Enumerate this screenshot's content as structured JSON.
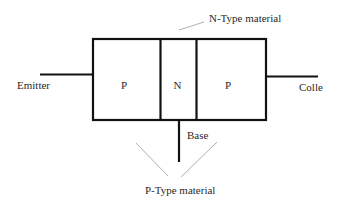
{
  "diagram": {
    "regions": [
      {
        "label": "P",
        "type": "P-Type"
      },
      {
        "label": "N",
        "type": "N-Type"
      },
      {
        "label": "P",
        "type": "P-Type"
      }
    ],
    "terminals": {
      "emitter": "Emitter",
      "base": "Base",
      "collector": "Colle"
    },
    "annotations": {
      "n_type": "N-Type material",
      "p_type": "P-Type material"
    },
    "colors": {
      "stroke": "#111111",
      "leader": "#9a9a9a",
      "text": "#2a2a2a",
      "background": "#ffffff"
    }
  }
}
